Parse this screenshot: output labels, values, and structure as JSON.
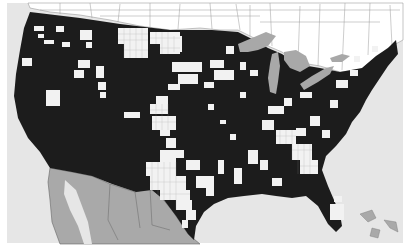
{
  "map": {
    "type": "choropleth",
    "region": "United States counties with surrounding Canada and Mexico",
    "legend": null,
    "title": null,
    "colors": {
      "background": "#ffffff",
      "ocean": "#e6e6e6",
      "us_filled": "#1c1c1c",
      "us_unfilled": "#f4f4f4",
      "canada": "#ffffff",
      "mexico": "#a9a9a9",
      "lakes": "#a8a8a8",
      "borders": "#777777"
    },
    "regions": [
      {
        "name": "USA",
        "style": "county choropleth (black = category present, white = absent)"
      },
      {
        "name": "Canada",
        "style": "white with province/census outlines"
      },
      {
        "name": "Mexico",
        "style": "gray with state outlines"
      },
      {
        "name": "Great Lakes",
        "style": "gray water"
      },
      {
        "name": "Ocean",
        "style": "light gray"
      }
    ]
  }
}
